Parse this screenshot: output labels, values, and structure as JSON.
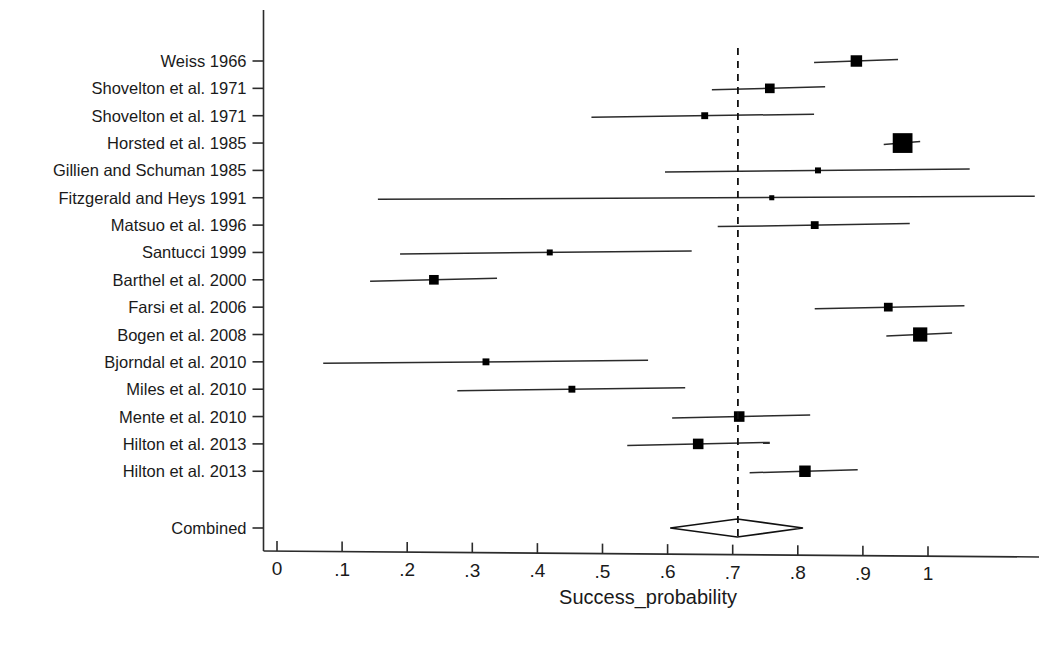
{
  "chart_data": {
    "type": "forest",
    "title": "",
    "xlabel": "Success_probability",
    "ylabel": "",
    "xlim": [
      0,
      1.15
    ],
    "xticks": [
      0,
      0.1,
      0.2,
      0.3,
      0.4,
      0.5,
      0.6,
      0.7,
      0.8,
      0.9,
      1
    ],
    "xticklabels": [
      "0",
      ".1",
      ".2",
      ".3",
      ".4",
      ".5",
      ".6",
      ".7",
      ".8",
      ".9",
      "1"
    ],
    "grid": false,
    "legend": "none",
    "null_line": 0.708,
    "combined": {
      "label": "Combined",
      "estimate": 0.707,
      "ci_low": 0.604,
      "ci_high": 0.808
    },
    "categories": [
      "Weiss 1966",
      "Shovelton et al. 1971",
      "Shovelton et al. 1971",
      "Horsted et al. 1985",
      "Gillien and Schuman 1985",
      "Fitzgerald and Heys 1991",
      "Matsuo et al. 1996",
      "Santucci 1999",
      "Barthel et al. 2000",
      "Farsi et al. 2006",
      "Bogen et al. 2008",
      "Bjorndal et al. 2010",
      "Miles et al. 2010",
      "Mente et al. 2010",
      "Hilton et al. 2013",
      "Hilton et al. 2013"
    ],
    "studies": [
      {
        "label": "Weiss 1966",
        "estimate": 0.89,
        "ci_low": 0.825,
        "ci_high": 0.954,
        "weight": 9
      },
      {
        "label": "Shovelton et al. 1971",
        "estimate": 0.757,
        "ci_low": 0.668,
        "ci_high": 0.842,
        "weight": 7
      },
      {
        "label": "Shovelton et al. 1971",
        "estimate": 0.657,
        "ci_low": 0.483,
        "ci_high": 0.825,
        "weight": 4
      },
      {
        "label": "Horsted et al. 1985",
        "estimate": 0.961,
        "ci_low": 0.932,
        "ci_high": 0.988,
        "weight": 18
      },
      {
        "label": "Gillien and Schuman 1985",
        "estimate": 0.831,
        "ci_low": 0.596,
        "ci_high": 1.064,
        "weight": 3
      },
      {
        "label": "Fitzgerald and Heys 1991",
        "estimate": 0.76,
        "ci_low": 0.155,
        "ci_high": 1.164,
        "weight": 2
      },
      {
        "label": "Matsuo et al. 1996",
        "estimate": 0.826,
        "ci_low": 0.677,
        "ci_high": 0.972,
        "weight": 5
      },
      {
        "label": "Santucci 1999",
        "estimate": 0.419,
        "ci_low": 0.189,
        "ci_high": 0.637,
        "weight": 3
      },
      {
        "label": "Barthel et al. 2000",
        "estimate": 0.241,
        "ci_low": 0.143,
        "ci_high": 0.338,
        "weight": 7
      },
      {
        "label": "Farsi et al. 2006",
        "estimate": 0.939,
        "ci_low": 0.826,
        "ci_high": 1.056,
        "weight": 6
      },
      {
        "label": "Bogen et al. 2008",
        "estimate": 0.988,
        "ci_low": 0.936,
        "ci_high": 1.037,
        "weight": 12
      },
      {
        "label": "Bjorndal et al. 2010",
        "estimate": 0.321,
        "ci_low": 0.071,
        "ci_high": 0.57,
        "weight": 4
      },
      {
        "label": "Miles et al. 2010",
        "estimate": 0.453,
        "ci_low": 0.277,
        "ci_high": 0.627,
        "weight": 4
      },
      {
        "label": "Mente et al. 2010",
        "estimate": 0.71,
        "ci_low": 0.607,
        "ci_high": 0.819,
        "weight": 8
      },
      {
        "label": "Hilton et al. 2013",
        "estimate": 0.647,
        "ci_low": 0.538,
        "ci_high": 0.757,
        "weight": 8
      },
      {
        "label": "Hilton et al. 2013",
        "estimate": 0.811,
        "ci_low": 0.726,
        "ci_high": 0.892,
        "weight": 9
      }
    ]
  }
}
